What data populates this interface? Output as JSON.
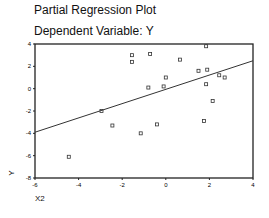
{
  "chart_data": {
    "type": "scatter",
    "title": "Partial Regression Plot",
    "subtitle": "Dependent Variable: Y",
    "xlabel": "X2",
    "ylabel": "Y",
    "xlim": [
      -6,
      4
    ],
    "ylim": [
      -8,
      4
    ],
    "xticks": [
      -6,
      -4,
      -2,
      0,
      2,
      4
    ],
    "yticks": [
      4,
      2,
      0,
      -2,
      -4,
      -6,
      -8
    ],
    "grid": false,
    "legend": null,
    "points": [
      {
        "x": -1.55,
        "y": 3.0
      },
      {
        "x": -1.55,
        "y": 2.4
      },
      {
        "x": -0.72,
        "y": 3.1
      },
      {
        "x": 0.65,
        "y": 2.6
      },
      {
        "x": 1.85,
        "y": 3.8
      },
      {
        "x": 0.0,
        "y": 1.0
      },
      {
        "x": -0.8,
        "y": 0.1
      },
      {
        "x": -0.1,
        "y": 0.2
      },
      {
        "x": 1.5,
        "y": 1.6
      },
      {
        "x": 1.9,
        "y": 1.7
      },
      {
        "x": 2.45,
        "y": 1.2
      },
      {
        "x": 2.7,
        "y": 1.0
      },
      {
        "x": 1.85,
        "y": 0.4
      },
      {
        "x": 2.15,
        "y": -1.1
      },
      {
        "x": -2.95,
        "y": -2.0
      },
      {
        "x": -2.45,
        "y": -3.3
      },
      {
        "x": -1.15,
        "y": -4.0
      },
      {
        "x": -0.4,
        "y": -3.2
      },
      {
        "x": 1.75,
        "y": -2.9
      },
      {
        "x": -4.45,
        "y": -6.1
      }
    ],
    "fit_line": {
      "x": [
        -6,
        4
      ],
      "y": [
        -3.9,
        2.5
      ]
    }
  }
}
